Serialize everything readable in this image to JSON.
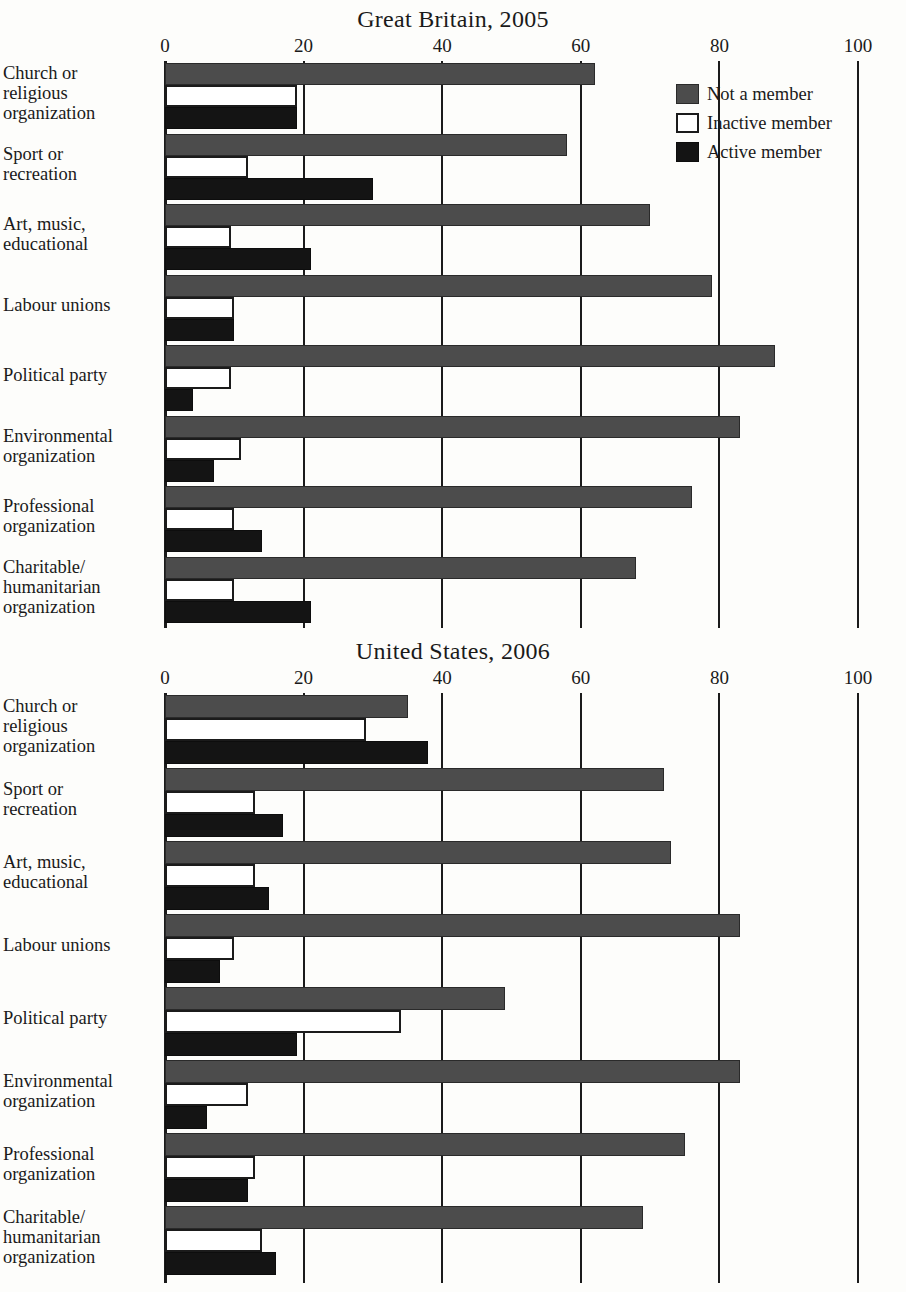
{
  "figure": {
    "legend": {
      "position": "top-right",
      "items": [
        {
          "key": "not",
          "label": "Not a member",
          "color": "#4c4c4c"
        },
        {
          "key": "inactive",
          "label": "Inactive member",
          "color": "#ffffff"
        },
        {
          "key": "active",
          "label": "Active member",
          "color": "#141414"
        }
      ]
    },
    "axis": {
      "ticks": [
        "0",
        "20",
        "40",
        "60",
        "80",
        "100"
      ],
      "min": 0,
      "max": 100
    }
  },
  "chart_data": [
    {
      "type": "bar",
      "orientation": "horizontal",
      "title": "Great Britain, 2005",
      "xlabel": "",
      "ylabel": "",
      "xlim": [
        0,
        100
      ],
      "grid": true,
      "tick_values": [
        0,
        20,
        40,
        60,
        80,
        100
      ],
      "legend_position": "top-right",
      "categories": [
        "Church or\nreligious\norganization",
        "Sport or\nrecreation",
        "Art, music,\neducational",
        "Labour unions",
        "Political party",
        "Environmental\norganization",
        "Professional\norganization",
        "Charitable/\nhumanitarian\norganization"
      ],
      "series": [
        {
          "name": "Not a member",
          "values": [
            62,
            58,
            70,
            79,
            88,
            83,
            76,
            68
          ]
        },
        {
          "name": "Inactive member",
          "values": [
            19,
            12,
            9.5,
            10,
            9.5,
            11,
            10,
            10
          ]
        },
        {
          "name": "Active member",
          "values": [
            19,
            30,
            21,
            10,
            4,
            7,
            14,
            21
          ]
        }
      ]
    },
    {
      "type": "bar",
      "orientation": "horizontal",
      "title": "United States, 2006",
      "xlabel": "",
      "ylabel": "",
      "xlim": [
        0,
        100
      ],
      "grid": true,
      "tick_values": [
        0,
        20,
        40,
        60,
        80,
        100
      ],
      "legend_position": "top-right",
      "categories": [
        "Church or\nreligious\norganization",
        "Sport or\nrecreation",
        "Art, music,\neducational",
        "Labour unions",
        "Political party",
        "Environmental\norganization",
        "Professional\norganization",
        "Charitable/\nhumanitarian\norganization"
      ],
      "series": [
        {
          "name": "Not a member",
          "values": [
            35,
            72,
            73,
            83,
            49,
            83,
            75,
            69
          ]
        },
        {
          "name": "Inactive member",
          "values": [
            29,
            13,
            13,
            10,
            34,
            12,
            13,
            14
          ]
        },
        {
          "name": "Active member",
          "values": [
            38,
            17,
            15,
            8,
            19,
            6,
            12,
            16
          ]
        }
      ]
    }
  ]
}
